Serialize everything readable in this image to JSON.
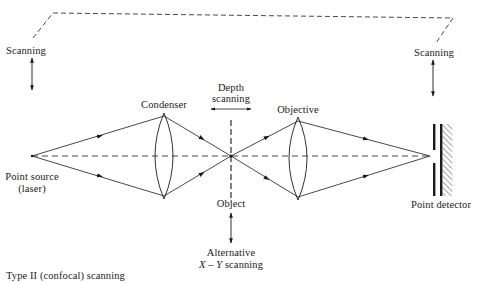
{
  "diagram": {
    "type": "optical-path",
    "caption": "Type II (confocal) scanning",
    "labels": {
      "scanning_left": "Scanning",
      "scanning_right": "Scanning",
      "condenser": "Condenser",
      "depth_scanning_line1": "Depth",
      "depth_scanning_line2": "scanning",
      "objective": "Objective",
      "point_source_line1": "Point source",
      "point_source_line2": "(laser)",
      "object": "Object",
      "alternative_line1": "Alternative",
      "alternative_xy": "X – Y",
      "alternative_scanning": " scanning",
      "point_detector": "Point detector"
    },
    "components": [
      {
        "id": "point-source",
        "name": "Point source (laser)"
      },
      {
        "id": "condenser",
        "name": "Condenser lens"
      },
      {
        "id": "object",
        "name": "Object (focal plane)"
      },
      {
        "id": "objective",
        "name": "Objective lens"
      },
      {
        "id": "point-detector",
        "name": "Point detector with pinhole"
      }
    ],
    "connections": [
      {
        "from": "point-source",
        "to": "condenser",
        "style": "ray"
      },
      {
        "from": "condenser",
        "to": "object",
        "style": "ray"
      },
      {
        "from": "object",
        "to": "objective",
        "style": "ray"
      },
      {
        "from": "objective",
        "to": "point-detector",
        "style": "ray"
      },
      {
        "from": "point-source",
        "to": "point-detector",
        "style": "dashed optical axis"
      },
      {
        "from": "scanning_left",
        "to": "scanning_right",
        "style": "dashed linkage (synchronized scanning)"
      }
    ],
    "colors": {
      "line": "#1a1a1a",
      "background": "#ffffff"
    }
  }
}
